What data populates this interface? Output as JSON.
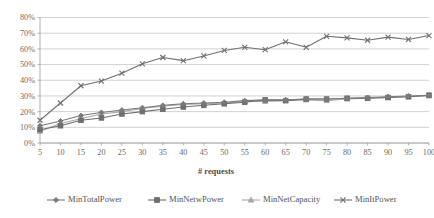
{
  "chart_data": {
    "type": "line",
    "title": "",
    "xlabel": "# requests",
    "ylabel": "",
    "x": [
      5,
      10,
      15,
      20,
      25,
      30,
      35,
      40,
      45,
      50,
      55,
      60,
      65,
      70,
      75,
      80,
      85,
      90,
      95,
      100
    ],
    "xtick_labels": [
      "5",
      "10",
      "15",
      "20",
      "25",
      "30",
      "35",
      "40",
      "45",
      "50",
      "55",
      "60",
      "65",
      "70",
      "75",
      "80",
      "85",
      "90",
      "95",
      "100"
    ],
    "ytick_labels": [
      "0%",
      "10%",
      "20%",
      "30%",
      "40%",
      "50%",
      "60%",
      "70%",
      "80%"
    ],
    "ytick_values": [
      0,
      10,
      20,
      30,
      40,
      50,
      60,
      70,
      80
    ],
    "ylim": [
      0,
      80
    ],
    "xlim": [
      5,
      100
    ],
    "grid": "horizontal",
    "legend_position": "bottom",
    "series": [
      {
        "name": "MinTotalPower",
        "marker": "diamond",
        "color": "#7a7a7a",
        "values": [
          11,
          14,
          17.5,
          19.5,
          21,
          22.5,
          24,
          25,
          25.5,
          26,
          27,
          27.5,
          27.5,
          28,
          28,
          28.5,
          29,
          29.5,
          30,
          30.5
        ]
      },
      {
        "name": "MinNetwPower",
        "marker": "square",
        "color": "#6e6e6e",
        "values": [
          8.5,
          11,
          14.5,
          16,
          18.5,
          20,
          21.5,
          23,
          24,
          25,
          26,
          27.5,
          27,
          28,
          28,
          28.5,
          28.5,
          29,
          29.5,
          30.5
        ]
      },
      {
        "name": "MinNetCapacity",
        "marker": "triangle",
        "color": "#a8a8a8",
        "values": [
          7.5,
          12.5,
          15.5,
          18.5,
          20,
          22,
          23.5,
          24.5,
          25,
          25.5,
          26.5,
          26.5,
          27,
          27.5,
          27,
          28,
          28.5,
          29,
          29.5,
          30
        ]
      },
      {
        "name": "MinItPower",
        "marker": "x",
        "color": "#707070",
        "values": [
          14.5,
          25.5,
          36.5,
          39.5,
          44.5,
          50.5,
          54.5,
          52.5,
          55.5,
          59,
          61,
          59.5,
          64.5,
          61,
          68,
          67,
          65.5,
          67.5,
          66,
          68.5
        ]
      }
    ]
  },
  "legend": {
    "items": [
      {
        "label": "MinTotalPower"
      },
      {
        "label": "MinNetwPower"
      },
      {
        "label": "MinNetCapacity"
      },
      {
        "label": "MinItPower"
      }
    ]
  }
}
